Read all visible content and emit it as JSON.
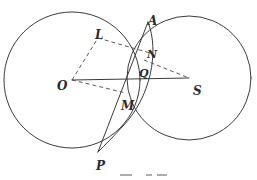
{
  "figure": {
    "type": "geometry-diagram",
    "canvas": {
      "width": 257,
      "height": 180,
      "background": "#ffffff"
    },
    "stroke": {
      "color": "#3a3a3a",
      "dash_color": "#4a4a4a",
      "solid_width": 1.0,
      "dash_width": 0.9,
      "dash_pattern": "4,3"
    },
    "points": [
      {
        "id": "O",
        "label": "O",
        "x": 72,
        "y": 80,
        "label_x": 57,
        "label_y": 80,
        "role": "center-large-circle",
        "size": "lg"
      },
      {
        "id": "S",
        "label": "S",
        "x": 189,
        "y": 78,
        "label_x": 193,
        "label_y": 85,
        "role": "center-right-circle",
        "size": "lg"
      },
      {
        "id": "A",
        "label": "A",
        "x": 148,
        "y": 22,
        "label_x": 148,
        "label_y": 15,
        "role": "upper-intersection",
        "size": "lg"
      },
      {
        "id": "L",
        "label": "L",
        "x": 98,
        "y": 38,
        "label_x": 95,
        "label_y": 29,
        "role": "parallelogram-vertex",
        "size": "lg"
      },
      {
        "id": "N",
        "label": "N",
        "x": 148,
        "y": 55,
        "label_x": 147,
        "label_y": 49,
        "role": "parallelogram-vertex",
        "size": "md"
      },
      {
        "id": "Q",
        "label": "Q",
        "x": 143,
        "y": 72,
        "label_x": 139,
        "label_y": 68,
        "role": "chord-axis-intersection",
        "size": "md"
      },
      {
        "id": "M",
        "label": "M",
        "x": 123,
        "y": 92,
        "label_x": 121,
        "label_y": 100,
        "role": "parallelogram-vertex",
        "size": "lg"
      },
      {
        "id": "P",
        "label": "P",
        "x": 98,
        "y": 152,
        "label_x": 96,
        "label_y": 160,
        "role": "lower-arc-endpoint",
        "size": "lg"
      }
    ],
    "circles": [
      {
        "id": "circle-O",
        "name": "large-circle",
        "cx": 72,
        "cy": 80,
        "r": 68,
        "style": "solid"
      },
      {
        "id": "circle-S",
        "name": "right-circle",
        "cx": 189,
        "cy": 78,
        "r": 62,
        "style": "solid"
      }
    ],
    "arcs": [
      {
        "id": "arc-APQ",
        "name": "arc-through-A-Q-P",
        "path": "M 148 22 C 160 52 150 98 123 126 C 114 136 105 145 98 152",
        "style": "solid"
      }
    ],
    "segments": [
      {
        "id": "seg-OS",
        "name": "axis-O-to-S",
        "from": "O",
        "to": "S",
        "x1": 72,
        "y1": 80,
        "x2": 189,
        "y2": 78,
        "style": "solid"
      },
      {
        "id": "seg-AP",
        "name": "chord-A-to-P",
        "from": "A",
        "to": "P",
        "x1": 148,
        "y1": 22,
        "x2": 98,
        "y2": 152,
        "style": "solid"
      }
    ],
    "dashed_segments": [
      {
        "id": "dash-OL",
        "name": "parallelogram-side-O-L",
        "x1": 72,
        "y1": 80,
        "x2": 98,
        "y2": 38
      },
      {
        "id": "dash-LN",
        "name": "parallelogram-side-L-N",
        "x1": 98,
        "y1": 38,
        "x2": 150,
        "y2": 53
      },
      {
        "id": "dash-OM",
        "name": "parallelogram-side-O-M",
        "x1": 72,
        "y1": 80,
        "x2": 126,
        "y2": 93
      },
      {
        "id": "dash-NS",
        "name": "dashed-segment-N-to-S",
        "x1": 144,
        "y1": 60,
        "x2": 189,
        "y2": 78
      }
    ],
    "caption_fragments": [
      {
        "id": "frag-1",
        "x": 120,
        "y": 174,
        "width": 12
      },
      {
        "id": "frag-2",
        "x": 146,
        "y": 174,
        "width": 6
      },
      {
        "id": "frag-3",
        "x": 157,
        "y": 174,
        "width": 10
      }
    ]
  }
}
